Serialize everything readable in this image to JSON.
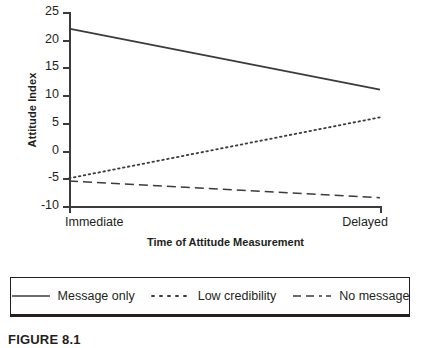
{
  "chart_data": {
    "type": "line",
    "title": "",
    "xlabel": "Time of Attitude Measurement",
    "ylabel": "Attitude Index",
    "x": [
      "Immediate",
      "Delayed"
    ],
    "xtick_labels": [
      "Immediate",
      "Delayed"
    ],
    "ytick_labels": [
      "25",
      "20",
      "15",
      "10",
      "5",
      "0",
      "-5",
      "-10"
    ],
    "yticks": [
      25,
      20,
      15,
      10,
      5,
      0,
      -5,
      -10
    ],
    "ylim": [
      -10,
      25
    ],
    "grid": false,
    "legend_position": "below-plot",
    "series": [
      {
        "name": "Message only",
        "linestyle": "solid",
        "color": "#3b3b3d",
        "values": [
          22,
          11
        ]
      },
      {
        "name": "Low credibility",
        "linestyle": "dotted",
        "color": "#3b3b3d",
        "values": [
          -5,
          6
        ]
      },
      {
        "name": "No message",
        "linestyle": "dashed",
        "color": "#3b3b3d",
        "values": [
          -5.5,
          -8.5
        ]
      }
    ]
  },
  "axes": {
    "ylabel": "Attitude Index",
    "xlabel": "Time of Attitude Measurement",
    "ytick_0": "25",
    "ytick_1": "20",
    "ytick_2": "15",
    "ytick_3": "10",
    "ytick_4": "5",
    "ytick_5": "0",
    "ytick_6": "-5",
    "ytick_7": "-10",
    "xtick_0": "Immediate",
    "xtick_1": "Delayed"
  },
  "legend": {
    "items": [
      {
        "label": "Message only",
        "style": "solid"
      },
      {
        "label": "Low credibility",
        "style": "dotted"
      },
      {
        "label": "No message",
        "style": "dashed"
      }
    ]
  },
  "caption": {
    "text": "FIGURE 8.1"
  }
}
